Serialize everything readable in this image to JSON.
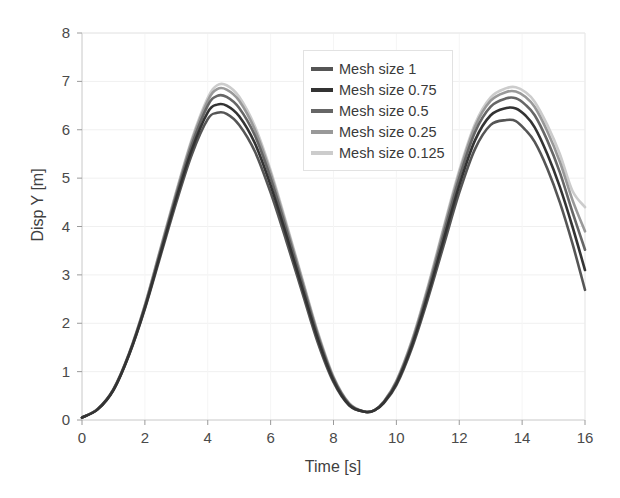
{
  "chart_data": {
    "type": "line",
    "title": "",
    "xlabel": "Time  [s]",
    "ylabel": "Disp Y [m]",
    "xlim": [
      0,
      16
    ],
    "ylim": [
      0,
      8
    ],
    "xticks": [
      0,
      2,
      4,
      6,
      8,
      10,
      12,
      14,
      16
    ],
    "yticks": [
      0,
      1,
      2,
      3,
      4,
      5,
      6,
      7,
      8
    ],
    "grid": "horizontal",
    "legend_position": "upper-center",
    "x": [
      0,
      0.5,
      1,
      1.5,
      2,
      2.5,
      3,
      3.5,
      4,
      4.3,
      4.6,
      5,
      5.5,
      6,
      6.5,
      7,
      7.5,
      8,
      8.5,
      9,
      9.3,
      9.6,
      10,
      10.5,
      11,
      11.5,
      12,
      12.5,
      13,
      13.5,
      13.8,
      14.1,
      14.4,
      14.8,
      15.2,
      15.6,
      16
    ],
    "series": [
      {
        "name": "Mesh size 1",
        "color": "#555555",
        "values": [
          0.05,
          0.22,
          0.62,
          1.35,
          2.3,
          3.4,
          4.5,
          5.5,
          6.22,
          6.35,
          6.33,
          6.1,
          5.55,
          4.7,
          3.7,
          2.65,
          1.6,
          0.78,
          0.3,
          0.17,
          0.2,
          0.35,
          0.72,
          1.5,
          2.5,
          3.6,
          4.7,
          5.6,
          6.1,
          6.2,
          6.18,
          6.0,
          5.75,
          5.2,
          4.5,
          3.65,
          2.69
        ]
      },
      {
        "name": "Mesh size 0.75",
        "color": "#333333",
        "values": [
          0.05,
          0.22,
          0.62,
          1.36,
          2.32,
          3.45,
          4.58,
          5.6,
          6.36,
          6.52,
          6.5,
          6.28,
          5.72,
          4.85,
          3.82,
          2.74,
          1.68,
          0.82,
          0.31,
          0.17,
          0.2,
          0.36,
          0.75,
          1.55,
          2.58,
          3.72,
          4.85,
          5.78,
          6.3,
          6.45,
          6.44,
          6.3,
          6.05,
          5.5,
          4.82,
          4.0,
          3.1
        ]
      },
      {
        "name": "Mesh size 0.5",
        "color": "#666666",
        "values": [
          0.05,
          0.23,
          0.63,
          1.37,
          2.35,
          3.5,
          4.65,
          5.7,
          6.5,
          6.7,
          6.68,
          6.45,
          5.88,
          5.0,
          3.94,
          2.84,
          1.75,
          0.86,
          0.33,
          0.17,
          0.2,
          0.37,
          0.78,
          1.6,
          2.66,
          3.84,
          5.0,
          5.95,
          6.48,
          6.65,
          6.65,
          6.52,
          6.3,
          5.78,
          5.12,
          4.3,
          3.52
        ]
      },
      {
        "name": "Mesh size 0.25",
        "color": "#999999",
        "values": [
          0.05,
          0.23,
          0.64,
          1.38,
          2.37,
          3.54,
          4.7,
          5.78,
          6.6,
          6.84,
          6.83,
          6.6,
          6.0,
          5.1,
          4.02,
          2.9,
          1.79,
          0.88,
          0.34,
          0.17,
          0.2,
          0.38,
          0.8,
          1.64,
          2.72,
          3.93,
          5.1,
          6.06,
          6.6,
          6.78,
          6.79,
          6.68,
          6.47,
          5.97,
          5.34,
          4.55,
          3.9
        ]
      },
      {
        "name": "Mesh size 0.125",
        "color": "#cccccc",
        "values": [
          0.05,
          0.23,
          0.64,
          1.39,
          2.38,
          3.56,
          4.73,
          5.82,
          6.66,
          6.92,
          6.92,
          6.68,
          6.07,
          5.16,
          4.07,
          2.94,
          1.82,
          0.9,
          0.35,
          0.17,
          0.2,
          0.38,
          0.81,
          1.66,
          2.76,
          3.98,
          5.16,
          6.12,
          6.67,
          6.86,
          6.88,
          6.78,
          6.58,
          6.1,
          5.5,
          4.74,
          4.4
        ]
      }
    ]
  },
  "axes": {
    "ylabel": "Disp Y [m]",
    "xlabel": "Time  [s]"
  }
}
